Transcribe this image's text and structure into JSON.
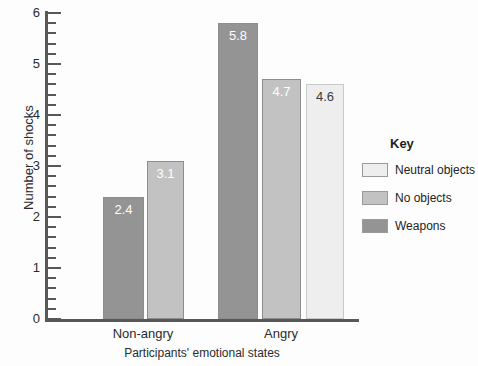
{
  "chart_data": {
    "type": "bar",
    "title": "",
    "xlabel": "Participants' emotional states",
    "ylabel": "Number of shocks",
    "ylim": [
      0,
      6
    ],
    "y_major_step": 1,
    "y_minor_step": 0.2,
    "grid": false,
    "legend_position": "right",
    "legend_title": "Key",
    "y_tick_labels": [
      "0",
      "1",
      "2",
      "3",
      "4",
      "5",
      "6"
    ],
    "categories": [
      "Non-angry",
      "Angry"
    ],
    "series": [
      {
        "name": "Weapons",
        "color": "#949494",
        "label_color": "#ffffff",
        "values": [
          2.4,
          5.8
        ]
      },
      {
        "name": "No objects",
        "color": "#c2c2c2",
        "label_color": "#ffffff",
        "values": [
          3.1,
          4.7
        ]
      },
      {
        "name": "Neutral objects",
        "color": "#eeeeee",
        "label_color": "#3a3a3a",
        "values": [
          null,
          4.6
        ]
      }
    ],
    "legend_entries": [
      {
        "label": "Neutral objects",
        "color": "#eeeeee"
      },
      {
        "label": "No objects",
        "color": "#c2c2c2"
      },
      {
        "label": "Weapons",
        "color": "#949494"
      }
    ],
    "bar_labels": {
      "non_angry_weapons": "2.4",
      "non_angry_no_objects": "3.1",
      "angry_weapons": "5.8",
      "angry_no_objects": "4.7",
      "angry_neutral_objects": "4.6"
    }
  },
  "colors": {
    "axis": "#585858",
    "text": "#2b2b2b",
    "background": "#ffffff"
  }
}
